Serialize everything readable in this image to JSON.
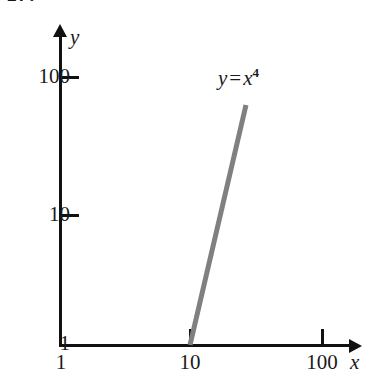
{
  "figure": {
    "number_label": "17.",
    "background_color": "#ffffff",
    "axis_color": "#111111",
    "curve_color": "#808080"
  },
  "chart_data": {
    "type": "line",
    "title": "",
    "subtitle": "",
    "xlabel": "x",
    "ylabel": "y",
    "xscale": "log",
    "yscale": "log",
    "xlim": [
      1,
      100
    ],
    "ylim": [
      1,
      100
    ],
    "xticks": [
      1,
      10,
      100
    ],
    "xticklabels": [
      "1",
      "10",
      "100"
    ],
    "yticks": [
      1,
      10,
      100
    ],
    "yticklabels": [
      "1",
      "10",
      "100"
    ],
    "grid": false,
    "legend": "none",
    "series": [
      {
        "name": "y = x^4",
        "annotation": "y = x 4",
        "color": "#808080",
        "x": [
          10,
          30
        ],
        "y": [
          1,
          65
        ],
        "points_px": [
          [
            190,
            345
          ],
          [
            246,
            105
          ]
        ]
      }
    ],
    "annotations": [
      {
        "text_parts": {
          "lhs": "y",
          "operator": "=",
          "base": "x",
          "exponent": "4"
        },
        "position_px": [
          218,
          68
        ]
      }
    ]
  },
  "axes": {
    "y": {
      "name": "y",
      "ticks": [
        {
          "label": "100",
          "y_px": 76
        },
        {
          "label": "10",
          "y_px": 214
        },
        {
          "label": "1",
          "y_px": 343
        }
      ]
    },
    "x": {
      "name": "x",
      "ticks": [
        {
          "label": "1",
          "x_px": 60
        },
        {
          "label": "10",
          "x_px": 190
        },
        {
          "label": "100",
          "x_px": 322
        }
      ]
    }
  }
}
